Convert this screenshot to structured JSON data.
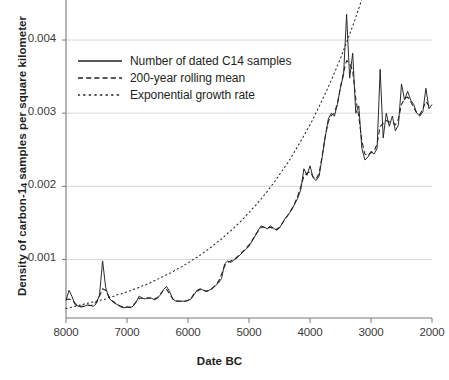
{
  "figure": {
    "width": 439,
    "height": 380,
    "background": "#ffffff",
    "ink_color": "#231f20",
    "gridline_color": "#d9d9d9",
    "axis_color": "#7a7a7a"
  },
  "axes": {
    "x_title": "Date BC",
    "y_title_pre": "Density of carbon-1",
    "y_title_sub": "4",
    "y_title_post": " samples per square kilometer",
    "y_title_full": "Density of carbon-14 samples per square kilometer",
    "x_ticks": [
      "8000",
      "7000",
      "6000",
      "5000",
      "4000",
      "3000",
      "2000"
    ],
    "y_ticks": [
      "0.004",
      "0.003",
      "0.002",
      "0.001"
    ],
    "x_range_bc": [
      8000,
      2000
    ],
    "y_range": [
      0.0002,
      0.00452
    ],
    "x_reversed": true,
    "grid": "horizontal"
  },
  "legend": {
    "position": "inside-top-left",
    "items": [
      {
        "label": "Number of dated C14 samples",
        "style": "solid",
        "swatch": "line-solid-icon"
      },
      {
        "label": "200-year rolling mean",
        "style": "dashed",
        "swatch": "line-dashed-icon"
      },
      {
        "label": "Exponential growth rate",
        "style": "dotted",
        "swatch": "line-dotted-icon"
      }
    ]
  },
  "caption": "",
  "chart_data": {
    "type": "line",
    "title": "",
    "xlabel": "Date BC",
    "ylabel": "Density of carbon-14 samples per square kilometer",
    "xlim": [
      8000,
      2000
    ],
    "ylim": [
      0.0002,
      0.00452
    ],
    "x_reversed": true,
    "grid": true,
    "legend_position": "inside-top-left",
    "x": [
      8000,
      7950,
      7900,
      7850,
      7800,
      7750,
      7700,
      7650,
      7600,
      7550,
      7500,
      7450,
      7400,
      7350,
      7300,
      7250,
      7200,
      7150,
      7100,
      7050,
      7000,
      6950,
      6900,
      6850,
      6800,
      6750,
      6700,
      6650,
      6600,
      6550,
      6500,
      6450,
      6400,
      6350,
      6300,
      6250,
      6200,
      6150,
      6100,
      6050,
      6000,
      5950,
      5900,
      5850,
      5800,
      5750,
      5700,
      5650,
      5600,
      5550,
      5500,
      5450,
      5400,
      5350,
      5300,
      5250,
      5200,
      5150,
      5100,
      5050,
      5000,
      4950,
      4900,
      4850,
      4800,
      4750,
      4700,
      4650,
      4600,
      4550,
      4500,
      4450,
      4400,
      4350,
      4300,
      4250,
      4200,
      4150,
      4100,
      4050,
      4000,
      3950,
      3900,
      3850,
      3800,
      3750,
      3700,
      3650,
      3600,
      3550,
      3500,
      3450,
      3400,
      3350,
      3300,
      3250,
      3200,
      3150,
      3100,
      3050,
      3000,
      2950,
      2900,
      2850,
      2800,
      2750,
      2700,
      2650,
      2600,
      2550,
      2500,
      2450,
      2400,
      2350,
      2300,
      2250,
      2200,
      2150,
      2100,
      2050,
      2000
    ],
    "series": [
      {
        "name": "Number of dated C14 samples",
        "style": "solid",
        "values": [
          0.00044,
          0.00058,
          0.00049,
          0.00038,
          0.00036,
          0.00035,
          0.00036,
          0.00038,
          0.00037,
          0.00036,
          0.0004,
          0.00052,
          0.00098,
          0.00062,
          0.00048,
          0.00043,
          0.0004,
          0.00038,
          0.00035,
          0.00034,
          0.00035,
          0.00034,
          0.00036,
          0.00042,
          0.0005,
          0.00047,
          0.00046,
          0.00048,
          0.00047,
          0.00045,
          0.00047,
          0.00052,
          0.00059,
          0.00063,
          0.00056,
          0.00046,
          0.00043,
          0.00043,
          0.00043,
          0.00043,
          0.00044,
          0.00046,
          0.00052,
          0.00058,
          0.0006,
          0.00058,
          0.00056,
          0.00058,
          0.0006,
          0.00064,
          0.00068,
          0.00074,
          0.00094,
          0.00098,
          0.00096,
          0.00099,
          0.00102,
          0.00106,
          0.0011,
          0.00114,
          0.00118,
          0.00125,
          0.00132,
          0.0014,
          0.00146,
          0.00144,
          0.00142,
          0.00146,
          0.00143,
          0.0014,
          0.00143,
          0.0015,
          0.00157,
          0.00162,
          0.00168,
          0.00176,
          0.00184,
          0.00196,
          0.00224,
          0.00215,
          0.00228,
          0.00212,
          0.00208,
          0.00214,
          0.0024,
          0.00268,
          0.00292,
          0.003,
          0.00296,
          0.00312,
          0.00336,
          0.00352,
          0.00435,
          0.00348,
          0.00382,
          0.003,
          0.0031,
          0.00252,
          0.00236,
          0.0024,
          0.00248,
          0.00244,
          0.00252,
          0.0036,
          0.00266,
          0.003,
          0.00282,
          0.00296,
          0.00276,
          0.00284,
          0.0034,
          0.00318,
          0.0033,
          0.00318,
          0.00312,
          0.003,
          0.00296,
          0.00302,
          0.00334,
          0.00306,
          0.00312
        ]
      },
      {
        "name": "200-year rolling mean",
        "style": "dashed",
        "values": [
          0.00045,
          0.00046,
          0.00044,
          0.0004,
          0.00037,
          0.00036,
          0.00036,
          0.00037,
          0.00037,
          0.00038,
          0.00042,
          0.0005,
          0.0006,
          0.00058,
          0.0005,
          0.00044,
          0.00041,
          0.00038,
          0.00036,
          0.00035,
          0.00035,
          0.00035,
          0.00037,
          0.00042,
          0.00047,
          0.00047,
          0.00047,
          0.00047,
          0.00047,
          0.00046,
          0.00048,
          0.00053,
          0.00058,
          0.00059,
          0.00053,
          0.00046,
          0.00044,
          0.00043,
          0.00043,
          0.00043,
          0.00044,
          0.00047,
          0.00053,
          0.00057,
          0.00059,
          0.00058,
          0.00057,
          0.00058,
          0.00061,
          0.00065,
          0.0007,
          0.0008,
          0.00091,
          0.00096,
          0.00098,
          0.001,
          0.00103,
          0.00107,
          0.00111,
          0.00115,
          0.0012,
          0.00126,
          0.00133,
          0.00139,
          0.00144,
          0.00144,
          0.00143,
          0.00144,
          0.00142,
          0.00141,
          0.00144,
          0.0015,
          0.00156,
          0.00162,
          0.00169,
          0.00177,
          0.00187,
          0.002,
          0.00214,
          0.00218,
          0.0022,
          0.00213,
          0.0021,
          0.00218,
          0.00242,
          0.00268,
          0.00288,
          0.00297,
          0.003,
          0.00314,
          0.00335,
          0.00356,
          0.00372,
          0.00368,
          0.00358,
          0.0032,
          0.00295,
          0.00262,
          0.00244,
          0.00242,
          0.00246,
          0.00248,
          0.00258,
          0.00282,
          0.00286,
          0.0029,
          0.00288,
          0.00288,
          0.00284,
          0.00292,
          0.00312,
          0.0032,
          0.00322,
          0.00316,
          0.00308,
          0.003,
          0.00298,
          0.00306,
          0.00316,
          0.0031,
          0.00312
        ]
      },
      {
        "name": "Exponential growth rate",
        "style": "dotted",
        "values": [
          0.00033,
          0.00034,
          0.00035,
          0.00036,
          0.00037,
          0.00038,
          0.00039,
          0.0004,
          0.00041,
          0.00042,
          0.00043,
          0.00044,
          0.00045,
          0.00046,
          0.00048,
          0.00049,
          0.0005,
          0.00052,
          0.00053,
          0.00054,
          0.00056,
          0.00057,
          0.00059,
          0.0006,
          0.00062,
          0.00064,
          0.00065,
          0.00067,
          0.00069,
          0.00071,
          0.00073,
          0.00075,
          0.00077,
          0.00079,
          0.00081,
          0.00083,
          0.00086,
          0.00088,
          0.0009,
          0.00093,
          0.00095,
          0.00098,
          0.00101,
          0.00103,
          0.00106,
          0.00109,
          0.00112,
          0.00115,
          0.00118,
          0.00122,
          0.00125,
          0.00128,
          0.00132,
          0.00136,
          0.00139,
          0.00143,
          0.00147,
          0.00151,
          0.00155,
          0.0016,
          0.00164,
          0.00169,
          0.00173,
          0.00178,
          0.00183,
          0.00188,
          0.00193,
          0.00199,
          0.00204,
          0.0021,
          0.00216,
          0.00222,
          0.00228,
          0.00234,
          0.00241,
          0.00248,
          0.00255,
          0.00262,
          0.00269,
          0.00277,
          0.00284,
          0.00292,
          0.00301,
          0.00309,
          0.00318,
          0.00327,
          0.00336,
          0.00345,
          0.00355,
          0.00365,
          0.00375,
          0.00386,
          0.00397,
          0.00408,
          0.00419,
          0.00431,
          0.00443,
          0.00456,
          0.00469,
          0.00482,
          0.00496,
          0.0051,
          0.00524,
          0.00539,
          0.00554,
          0.0057,
          0.00586,
          0.00603,
          0.0062,
          0.00637,
          0.00655,
          0.00674,
          0.00693,
          0.00713,
          0.00733,
          0.00754,
          0.00775,
          0.00797,
          0.0082,
          0.00843,
          0.00867
        ]
      }
    ]
  }
}
